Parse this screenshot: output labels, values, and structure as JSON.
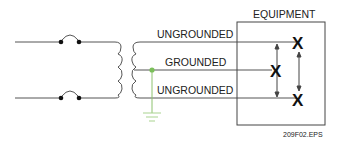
{
  "diagram": {
    "equipment_label": "EQUIPMENT",
    "wires": [
      {
        "label": "UNGROUNDED",
        "role": "ungrounded-top"
      },
      {
        "label": "GROUNDED",
        "role": "grounded-neutral"
      },
      {
        "label": "UNGROUNDED",
        "role": "ungrounded-bottom"
      }
    ],
    "load_marks": [
      "X",
      "X",
      "X"
    ],
    "figure_id": "209F02.EPS",
    "colors": {
      "wire": "#555555",
      "ground": "#8dc26f",
      "ground_dot": "#7bbf5a",
      "mark": "#111111"
    }
  }
}
